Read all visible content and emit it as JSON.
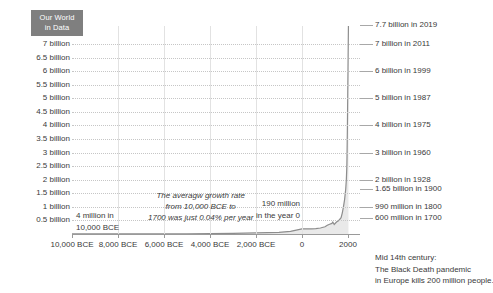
{
  "logo": {
    "line1": "Our World",
    "line2": "in Data",
    "background": "#7f7f7f",
    "text_color": "#ffffff"
  },
  "chart_data": {
    "type": "line",
    "title": "",
    "xlabel": "",
    "ylabel": "",
    "grid": true,
    "legend_position": "none",
    "xlim": [
      -10000,
      2020
    ],
    "ylim": [
      0,
      7700000000
    ],
    "y_tick_labels": [
      "7 billion",
      "6.5 billion",
      "6 billion",
      "5.5 billion",
      "5 billion",
      "4.5 billion",
      "4 billion",
      "3.5 billion",
      "3 billion",
      "2.5 billion",
      "2 billion",
      "1.5 billion",
      "1 billion",
      "0.5 billion"
    ],
    "y_tick_values": [
      7,
      6.5,
      6,
      5.5,
      5,
      4.5,
      4,
      3.5,
      3,
      2.5,
      2,
      1.5,
      1,
      0.5
    ],
    "x_tick_labels": [
      "10,000 BCE",
      "8,000 BCE",
      "6,000 BCE",
      "4,000 BCE",
      "2,000 BCE",
      "0",
      "2000"
    ],
    "x_tick_values": [
      -10000,
      -8000,
      -6000,
      -4000,
      -2000,
      0,
      2000
    ],
    "series": [
      {
        "name": "World population",
        "x": [
          -10000,
          -8000,
          -6000,
          -5000,
          -4000,
          -3000,
          -2000,
          -1000,
          -500,
          0,
          200,
          400,
          600,
          800,
          1000,
          1100,
          1200,
          1300,
          1340,
          1400,
          1500,
          1600,
          1700,
          1750,
          1800,
          1850,
          1900,
          1928,
          1950,
          1960,
          1975,
          1987,
          1999,
          2011,
          2019
        ],
        "values": [
          0.004,
          0.005,
          0.007,
          0.01,
          0.015,
          0.025,
          0.04,
          0.06,
          0.1,
          0.19,
          0.19,
          0.19,
          0.2,
          0.22,
          0.265,
          0.32,
          0.36,
          0.39,
          0.44,
          0.35,
          0.44,
          0.5,
          0.6,
          0.77,
          0.99,
          1.26,
          1.65,
          2.0,
          2.5,
          3.0,
          4.0,
          5.0,
          6.0,
          7.0,
          7.7
        ],
        "units": "billions"
      }
    ],
    "annotations": [
      {
        "id": "anno-4million",
        "lines": [
          "4 million in",
          "10,000 BCE"
        ]
      },
      {
        "id": "anno-rate",
        "lines": [
          "The averagw growth rate",
          "from 10,000 BCE to",
          "1700 was just 0.04% per year"
        ],
        "style": "italic"
      },
      {
        "id": "anno-year0",
        "lines": [
          "190 million",
          "in the year 0"
        ]
      },
      {
        "id": "note-blackdeath",
        "lines": [
          "Mid 14th century:",
          "The Black Death pandemic",
          "in Europe kills 200 million people."
        ]
      }
    ],
    "right_labels": [
      {
        "text": "7.7 billion in 2019",
        "value": 7.7
      },
      {
        "text": "7 billion in 2011",
        "value": 7.0
      },
      {
        "text": "6 billion in 1999",
        "value": 6.0
      },
      {
        "text": "5 billion in 1987",
        "value": 5.0
      },
      {
        "text": "4 billion in 1975",
        "value": 4.0
      },
      {
        "text": "3 billion in 1960",
        "value": 3.0
      },
      {
        "text": "2 billion in 1928",
        "value": 2.0
      },
      {
        "text": "1.65 billion in 1900",
        "value": 1.65
      },
      {
        "text": "990 million in 1800",
        "value": 0.99
      },
      {
        "text": "600 million in 1700",
        "value": 0.6
      }
    ],
    "colors": {
      "line": "#8d8d8d",
      "fill": "#e9e9e9",
      "grid": "#c6c6c6",
      "axis": "#9a9a9a",
      "text": "#3a3a3a"
    }
  }
}
